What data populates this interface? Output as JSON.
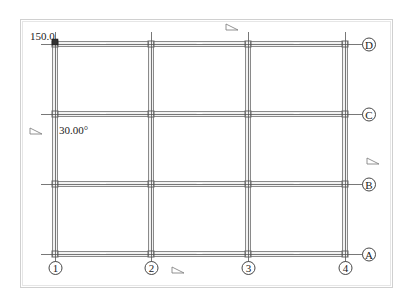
{
  "drawing": {
    "frame": {
      "outer": [
        20,
        19,
        392,
        287
      ],
      "inner": [
        22,
        21,
        390,
        285
      ],
      "color": "#d0d0d0"
    },
    "columns": [
      {
        "label": "1",
        "x": 55
      },
      {
        "label": "2",
        "x": 151
      },
      {
        "label": "3",
        "x": 248
      },
      {
        "label": "4",
        "x": 345
      }
    ],
    "rows": [
      {
        "label": "D",
        "y": 44
      },
      {
        "label": "C",
        "y": 114
      },
      {
        "label": "B",
        "y": 184
      },
      {
        "label": "A",
        "y": 254
      }
    ],
    "annotations": {
      "dimension": "150.0",
      "angle": "30.00°"
    },
    "triangle_markers": [
      {
        "x": 232,
        "y": 27
      },
      {
        "x": 36,
        "y": 131
      },
      {
        "x": 373,
        "y": 161
      },
      {
        "x": 178,
        "y": 270
      }
    ],
    "colors": {
      "axis_line": "#555555",
      "beam_edge": "#8a8a8a",
      "beam_fill": "#f2f2f2",
      "label": "#222222"
    }
  }
}
